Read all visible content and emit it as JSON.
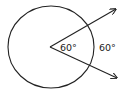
{
  "diagram": {
    "type": "circle-central-angle",
    "central_angle_label": "60°",
    "arc_label": "60°",
    "stroke_color": "#222222",
    "background": "#ffffff"
  }
}
